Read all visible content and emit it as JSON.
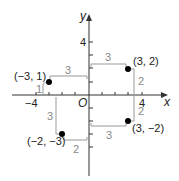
{
  "diagram": {
    "type": "coordinate-plane",
    "axes": {
      "x_label": "x",
      "y_label": "y",
      "origin_label": "O"
    },
    "tick_labels": {
      "x_neg": "−4",
      "x_pos": "4",
      "y_pos": "4"
    },
    "colors": {
      "axis": "#333333",
      "point": "#000000",
      "guide": "#999999",
      "guide_text": "#888888"
    },
    "points": [
      {
        "label": "(3, 2)",
        "x": 3,
        "y": 2,
        "h_dist": "3",
        "v_dist": "2"
      },
      {
        "label": "(−3, 1)",
        "x": -3,
        "y": 1,
        "h_dist": "3",
        "v_dist": "1"
      },
      {
        "label": "(−2, −3)",
        "x": -2,
        "y": -3,
        "h_dist": "2",
        "v_dist": "3"
      },
      {
        "label": "(3, −2)",
        "x": 3,
        "y": -2,
        "h_dist": "3",
        "v_dist": "2"
      }
    ]
  }
}
